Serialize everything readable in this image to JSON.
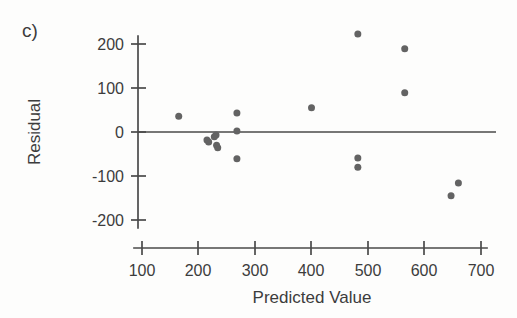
{
  "panel": {
    "label": "c)"
  },
  "chart_data": {
    "type": "scatter",
    "title": "",
    "subtitle": "",
    "xlabel": "Predicted Value",
    "ylabel": "Residual",
    "xlim": [
      100,
      700
    ],
    "ylim": [
      -230,
      240
    ],
    "xticks": [
      100,
      200,
      300,
      400,
      500,
      600,
      700
    ],
    "xtick_labels": [
      "100",
      "200",
      "300",
      "400",
      "500",
      "600",
      "700"
    ],
    "yticks": [
      -200,
      -100,
      0,
      100,
      200
    ],
    "ytick_labels": [
      "-200",
      "-100",
      "0",
      "100",
      "200"
    ],
    "grid": false,
    "legend": null,
    "reference_line": {
      "orientation": "horizontal",
      "value": 0,
      "label": ""
    },
    "marker": {
      "shape": "circle",
      "color": "#636363",
      "size": 7
    },
    "series": [
      {
        "name": "residuals",
        "points": [
          {
            "x": 165,
            "y": 36
          },
          {
            "x": 215,
            "y": -18
          },
          {
            "x": 218,
            "y": -23
          },
          {
            "x": 228,
            "y": -11
          },
          {
            "x": 231,
            "y": -7
          },
          {
            "x": 232,
            "y": -30
          },
          {
            "x": 234,
            "y": -36
          },
          {
            "x": 268,
            "y": 43
          },
          {
            "x": 268,
            "y": 2
          },
          {
            "x": 268,
            "y": -61
          },
          {
            "x": 400,
            "y": 55
          },
          {
            "x": 482,
            "y": 223
          },
          {
            "x": 482,
            "y": -59
          },
          {
            "x": 482,
            "y": -80
          },
          {
            "x": 565,
            "y": 189
          },
          {
            "x": 565,
            "y": 89
          },
          {
            "x": 647,
            "y": -145
          },
          {
            "x": 660,
            "y": -116
          }
        ]
      }
    ]
  },
  "colors": {
    "marker": "#636363",
    "axis": "#4a4a4a",
    "text": "#3c3c3c",
    "background": "#fdfdfc"
  }
}
